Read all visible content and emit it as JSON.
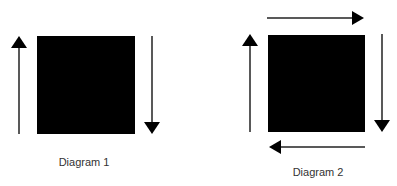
{
  "diagrams": [
    {
      "label": "Diagram 1",
      "square": {
        "x": 37,
        "y": 36,
        "w": 98,
        "h": 98,
        "color": "#000000"
      },
      "arrows": [
        {
          "direction": "up",
          "side": "left"
        },
        {
          "direction": "down",
          "side": "right"
        }
      ]
    },
    {
      "label": "Diagram 2",
      "square": {
        "x": 268,
        "y": 35,
        "w": 97,
        "h": 97,
        "color": "#000000"
      },
      "arrows": [
        {
          "direction": "right",
          "side": "top"
        },
        {
          "direction": "down",
          "side": "right"
        },
        {
          "direction": "left",
          "side": "bottom"
        },
        {
          "direction": "up",
          "side": "left"
        }
      ]
    }
  ]
}
